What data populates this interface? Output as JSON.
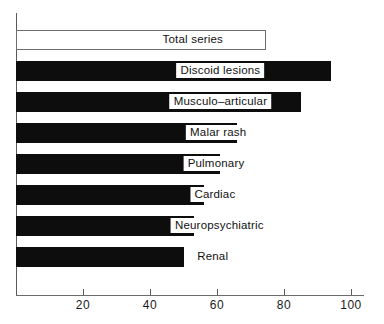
{
  "chart_data": {
    "type": "bar",
    "orientation": "horizontal",
    "title": "",
    "xlabel": "",
    "ylabel": "",
    "xlim": [
      0,
      104
    ],
    "grid": false,
    "legend": "none",
    "xticks": [
      20,
      40,
      60,
      80,
      100
    ],
    "xtick_labels": [
      "20",
      "40",
      "60",
      "80",
      "100"
    ],
    "categories": [
      "Total series",
      "Discoid lesions",
      "Musculo–articular",
      "Malar rash",
      "Pulmonary",
      "Cardiac",
      "Neuropsychiatric",
      "Renal"
    ],
    "values": [
      74,
      94,
      85,
      66,
      61,
      56,
      53,
      50
    ],
    "bars": [
      {
        "label": "Total series",
        "value": 74,
        "style": "hollow",
        "label_center": 74
      },
      {
        "label": "Discoid lesions",
        "value": 94,
        "style": "filled",
        "label_center": 99
      },
      {
        "label": "Musculo–articular",
        "value": 85,
        "style": "filled",
        "label_center": 99
      },
      {
        "label": "Malar rash",
        "value": 66,
        "style": "filled",
        "label_center": 97
      },
      {
        "label": "Pulmonary",
        "value": 61,
        "style": "filled",
        "label_center": 95
      },
      {
        "label": "Cardiac",
        "value": 56,
        "style": "filled",
        "label_center": 94
      },
      {
        "label": "Neuropsychiatric",
        "value": 53,
        "style": "filled",
        "label_center": 98
      },
      {
        "label": "Renal",
        "value": 50,
        "style": "filled",
        "label_center": 92
      }
    ],
    "colors": {
      "bar_fill": "#0d0d0d",
      "bar_hollow_fill": "#ffffff",
      "bar_outline": "#6e6e6e",
      "axis": "#5a5a5a",
      "label_text": "#111111",
      "background": "#ffffff"
    }
  }
}
